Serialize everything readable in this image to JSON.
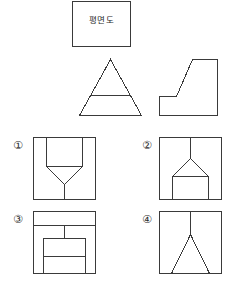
{
  "page": {
    "background_color": "#ffffff",
    "line_color": "#3a3a3a",
    "text_color": "#2a2a2a",
    "width": 236,
    "height": 296
  },
  "caption": {
    "label": "평면도",
    "box": {
      "x": 72,
      "y": 1,
      "width": 59,
      "height": 46
    }
  },
  "views": {
    "front_view": {
      "name": "front-view-triangle",
      "description": "정삼각형 내부에 수평선이 하나 그어진 정면도",
      "box": {
        "x": 79,
        "y": 59,
        "width": 63,
        "height": 57
      },
      "outline_points": "31,0 62,56 0,56",
      "inner_lines": [
        {
          "x1": 11,
          "y1": 36,
          "x2": 51,
          "y2": 36
        }
      ]
    },
    "side_view": {
      "name": "side-view-l-shape",
      "description": "경사면을 가진 L자 형태의 측면도",
      "box": {
        "x": 159,
        "y": 59,
        "width": 59,
        "height": 57
      },
      "outline_points": "0,37 0,56 58,56 58,0 33,0 17,37"
    }
  },
  "options": [
    {
      "number": "①",
      "name": "option-1",
      "label_position": {
        "x": 11,
        "y": 139
      },
      "box": {
        "x": 33,
        "y": 137,
        "width": 62,
        "height": 62
      },
      "description": "사각형 안에 두 수직선과 아래로 모이는 V자 그리고 중앙 수직선",
      "lines": [
        {
          "x1": 13,
          "y1": 0,
          "x2": 13,
          "y2": 29
        },
        {
          "x1": 49,
          "y1": 0,
          "x2": 49,
          "y2": 29
        },
        {
          "x1": 13,
          "y1": 29,
          "x2": 49,
          "y2": 29
        },
        {
          "x1": 13,
          "y1": 29,
          "x2": 31,
          "y2": 47
        },
        {
          "x1": 49,
          "y1": 29,
          "x2": 31,
          "y2": 47
        },
        {
          "x1": 31,
          "y1": 47,
          "x2": 31,
          "y2": 62
        }
      ]
    },
    {
      "number": "②",
      "name": "option-2",
      "label_position": {
        "x": 140,
        "y": 139
      },
      "box": {
        "x": 159,
        "y": 137,
        "width": 62,
        "height": 62
      },
      "description": "중앙 수직선에서 아래로 벌어지는 A자 지붕과 아래쪽 사각 구획",
      "lines": [
        {
          "x1": 31,
          "y1": 0,
          "x2": 31,
          "y2": 21
        },
        {
          "x1": 31,
          "y1": 21,
          "x2": 13,
          "y2": 39
        },
        {
          "x1": 31,
          "y1": 21,
          "x2": 49,
          "y2": 39
        },
        {
          "x1": 13,
          "y1": 39,
          "x2": 49,
          "y2": 39
        },
        {
          "x1": 13,
          "y1": 39,
          "x2": 13,
          "y2": 62
        },
        {
          "x1": 49,
          "y1": 39,
          "x2": 49,
          "y2": 62
        }
      ]
    },
    {
      "number": "③",
      "name": "option-3",
      "label_position": {
        "x": 11,
        "y": 213
      },
      "box": {
        "x": 33,
        "y": 211,
        "width": 62,
        "height": 62
      },
      "description": "상단 수평선과 중앙 수직선, 그 아래 가로로 분할된 사각형",
      "lines": [
        {
          "x1": 0,
          "y1": 14,
          "x2": 62,
          "y2": 14
        },
        {
          "x1": 31,
          "y1": 14,
          "x2": 31,
          "y2": 27
        },
        {
          "x1": 10,
          "y1": 27,
          "x2": 52,
          "y2": 27
        },
        {
          "x1": 10,
          "y1": 27,
          "x2": 10,
          "y2": 62
        },
        {
          "x1": 52,
          "y1": 27,
          "x2": 52,
          "y2": 62
        },
        {
          "x1": 10,
          "y1": 45,
          "x2": 52,
          "y2": 45
        }
      ]
    },
    {
      "number": "④",
      "name": "option-4",
      "label_position": {
        "x": 140,
        "y": 213
      },
      "box": {
        "x": 159,
        "y": 211,
        "width": 62,
        "height": 62
      },
      "description": "중앙 수직선에서 아래 양쪽으로 벌어지는 두 사선",
      "lines": [
        {
          "x1": 31,
          "y1": 0,
          "x2": 31,
          "y2": 23
        },
        {
          "x1": 31,
          "y1": 23,
          "x2": 12,
          "y2": 62
        },
        {
          "x1": 31,
          "y1": 23,
          "x2": 50,
          "y2": 62
        }
      ]
    }
  ]
}
